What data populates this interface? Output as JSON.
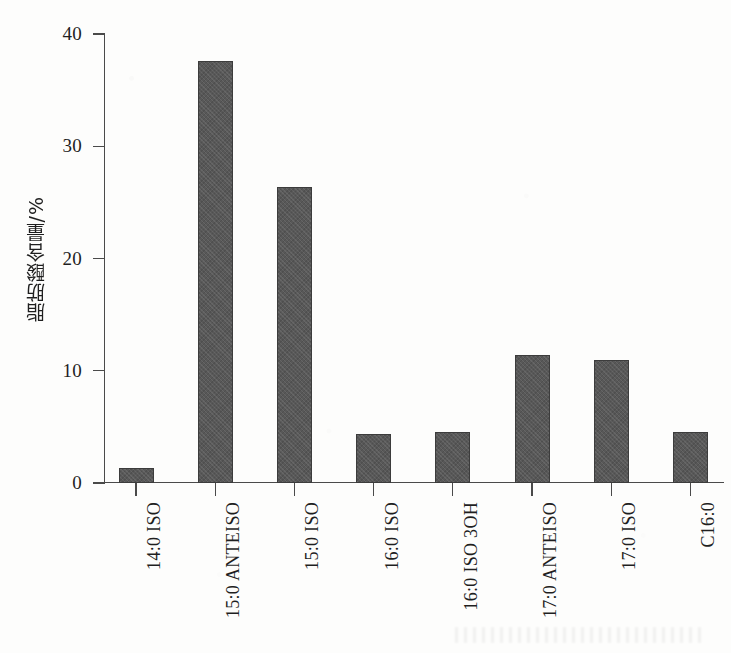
{
  "chart_data": {
    "type": "bar",
    "title": "",
    "xlabel": "",
    "ylabel": "脂肪酸含量/%",
    "ylim": [
      0,
      40
    ],
    "ytick_labels": [
      "0",
      "10",
      "20",
      "30",
      "40"
    ],
    "ytick_values": [
      0,
      10,
      20,
      30,
      40
    ],
    "grid": false,
    "legend": "none",
    "bar_color": "#585858",
    "axis_color": "#4a4a4a",
    "categories": [
      "14:0 ISO",
      "15:0 ANTEISO",
      "15:0 ISO",
      "16:0 ISO",
      "16:0 ISO 3OH",
      "17:0 ANTEISO",
      "17:0 ISO",
      "C16:0"
    ],
    "values": [
      1.3,
      37.6,
      26.4,
      4.4,
      4.5,
      11.4,
      11.0,
      4.5
    ]
  },
  "axis": {
    "y_title": "脂肪酸含量/%"
  }
}
